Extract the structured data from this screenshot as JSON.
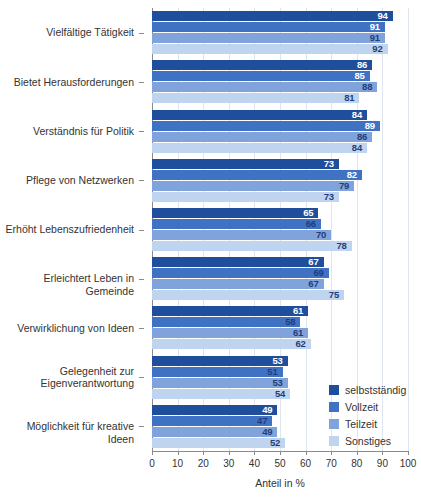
{
  "chart_data": {
    "type": "bar",
    "orientation": "horizontal",
    "title": "",
    "xlabel": "Anteil in %",
    "ylabel": "",
    "xlim": [
      0,
      100
    ],
    "xticks": [
      0,
      10,
      20,
      30,
      40,
      50,
      60,
      70,
      80,
      90,
      100
    ],
    "grid": true,
    "legend_position": "bottom-right",
    "categories": [
      "Vielfältige Tätigkeit",
      "Bietet Herausforderungen",
      "Verständnis für Politik",
      "Pflege von Netzwerken",
      "Erhöht Lebenszufriedenheit",
      "Erleichtert Leben in Gemeinde",
      "Verwirklichung von Ideen",
      "Gelegenheit zur\nEigenverantwortung",
      "Möglichkeit für kreative Ideen"
    ],
    "series": [
      {
        "name": "selbstständig",
        "color": "#1f4e9c",
        "values": [
          94,
          86,
          84,
          73,
          65,
          67,
          61,
          53,
          49
        ]
      },
      {
        "name": "Vollzeit",
        "color": "#4072c4",
        "values": [
          91,
          85,
          89,
          82,
          66,
          69,
          58,
          51,
          47
        ]
      },
      {
        "name": "Teilzeit",
        "color": "#7fa3da",
        "values": [
          91,
          88,
          86,
          79,
          70,
          67,
          61,
          53,
          49
        ]
      },
      {
        "name": "Sonstiges",
        "color": "#bfd5ef",
        "values": [
          92,
          81,
          84,
          73,
          78,
          75,
          62,
          54,
          52
        ]
      }
    ]
  },
  "legend": {
    "items": [
      {
        "label": "selbstständig",
        "color": "#1f4e9c"
      },
      {
        "label": "Vollzeit",
        "color": "#4072c4"
      },
      {
        "label": "Teilzeit",
        "color": "#7fa3da"
      },
      {
        "label": "Sonstiges",
        "color": "#bfd5ef"
      }
    ]
  },
  "axis": {
    "x_title": "Anteil in %",
    "x_tick_labels": [
      "0",
      "10",
      "20",
      "30",
      "40",
      "50",
      "60",
      "70",
      "80",
      "90",
      "100"
    ]
  }
}
